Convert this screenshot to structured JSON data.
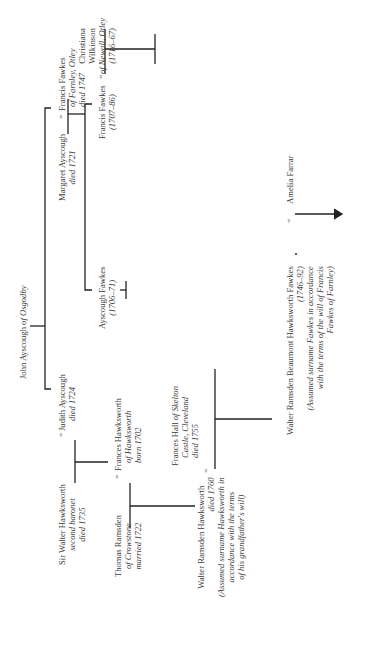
{
  "diagram": {
    "marriage_symbol": "=",
    "people": {
      "john_ayscough": {
        "name": "John Ayscough",
        "place": "of Osgodby"
      },
      "walter_hawksworth": {
        "name": "Sir Walter Hawksworth",
        "lines": [
          "second baronet",
          "died 1735"
        ]
      },
      "judith_ayscough": {
        "name": "Judith Ayscough",
        "lines": [
          "died 1724"
        ]
      },
      "margaret_ayscough": {
        "name": "Margaret Ayscough",
        "lines": [
          "died 1721"
        ]
      },
      "francis_fawkes_sr": {
        "name": "Francis Fawkes",
        "lines": [
          "of Farnley, Otley",
          "died 1747"
        ]
      },
      "thomas_ramsden": {
        "name": "Thomas Ramsden",
        "lines": [
          "of Crowstone",
          "married 1722"
        ]
      },
      "frances_hawksworth": {
        "name": "Frances Hawksworth",
        "lines": [
          "of Hawksworth",
          "born 1702"
        ]
      },
      "ayscough_fawkes": {
        "name": "Ayscough Fawkes",
        "lines": [
          "(1706–71)"
        ]
      },
      "francis_fawkes_jr": {
        "name": "Francis Fawkes",
        "lines": [
          "(1707–86)"
        ]
      },
      "christiana_wilkinson": {
        "name": "Christiana",
        "name2": "Wilkinson",
        "lines": [
          "of Newall, Otley",
          "(1716–67)"
        ]
      },
      "walter_ramsden_hawksworth": {
        "name": "Walter Ramsden Hawksworth",
        "lines": [
          "died 1760",
          "(Assumed surname Hawksworth in",
          "accordance with the terms",
          "of his grandfather's will)"
        ]
      },
      "frances_hall": {
        "name": "Frances Hall",
        "place": "of Skelton",
        "lines": [
          "Castle, Cleveland",
          "died 1755"
        ]
      },
      "walter_rbh_fawkes": {
        "name": "Walter Ramsden Beaumont Hawksworth Fawkes",
        "lines": [
          "(1746–92)",
          "(Assumed surname Fawkes in accordance",
          "with the terms of the will of Francis",
          "Fawkes of Farnley)"
        ]
      },
      "amelia_farrar": {
        "name": "Amelia Farrar"
      }
    }
  }
}
